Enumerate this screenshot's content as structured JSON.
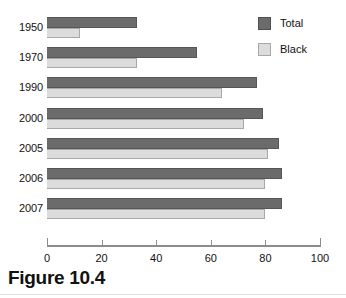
{
  "caption": "Figure 10.4",
  "legend": {
    "position": "top-right",
    "entries": [
      {
        "label": "Total",
        "swatch": "total",
        "color": "#6b6b6b"
      },
      {
        "label": "Black",
        "swatch": "black",
        "color": "#dcdcdc"
      }
    ]
  },
  "chart_data": {
    "type": "bar",
    "orientation": "horizontal",
    "title": "",
    "subtitle": "",
    "xlabel": "",
    "ylabel": "",
    "xlim": [
      0,
      100
    ],
    "ylim": null,
    "grid": false,
    "xticks": [
      0,
      20,
      40,
      60,
      80,
      100
    ],
    "xticklabels": [
      "0",
      "20",
      "40",
      "60",
      "80",
      "100"
    ],
    "categories": [
      "1950",
      "1970",
      "1990",
      "2000",
      "2005",
      "2006",
      "2007"
    ],
    "legend_position": "top-right",
    "series": [
      {
        "name": "Total",
        "color": "#6b6b6b",
        "values": [
          33,
          55,
          77,
          79,
          85,
          86,
          86
        ]
      },
      {
        "name": "Black",
        "color": "#dcdcdc",
        "values": [
          12,
          33,
          64,
          72,
          81,
          80,
          80
        ]
      }
    ]
  }
}
